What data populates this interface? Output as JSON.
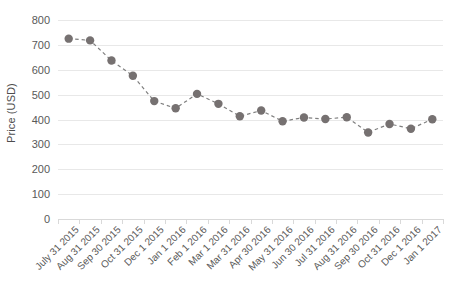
{
  "chart_data": {
    "type": "line",
    "title": "",
    "xlabel": "",
    "ylabel": "Price (USD)",
    "ylim": [
      0,
      800
    ],
    "y_ticks": [
      0,
      100,
      200,
      300,
      400,
      500,
      600,
      700,
      800
    ],
    "y_tick_labels": [
      "0",
      "100",
      "200",
      "300",
      "400",
      "500",
      "600",
      "700",
      "800"
    ],
    "grid": true,
    "legend": "none",
    "line_style": "dashed",
    "marker": "circle",
    "series_color": "#767171",
    "grid_color": "#e8e8e8",
    "categories": [
      "July 31 2015",
      "Aug 31 2015",
      "Sep 30 2015",
      "Oct 31 2015",
      "Dec 1 2015",
      "Jan 1 2016",
      "Feb 1 2016",
      "Mar 1 2016",
      "Mar 31 2016",
      "Apr 30 2016",
      "May 31 2016",
      "Jun 30 2016",
      "Jul 31 2016",
      "Aug 31 2016",
      "Sep 30 2016",
      "Oct 31 2016",
      "Dec 1 2016",
      "Jan 1 2017"
    ],
    "values": [
      725,
      718,
      637,
      576,
      474,
      445,
      503,
      463,
      413,
      436,
      393,
      408,
      402,
      409,
      348,
      382,
      363,
      401
    ],
    "series": [
      {
        "name": "Price",
        "values": [
          725,
          718,
          637,
          576,
          474,
          445,
          503,
          463,
          413,
          436,
          393,
          408,
          402,
          409,
          348,
          382,
          363,
          401
        ]
      }
    ]
  },
  "axis": {
    "y_title": "Price (USD)"
  }
}
